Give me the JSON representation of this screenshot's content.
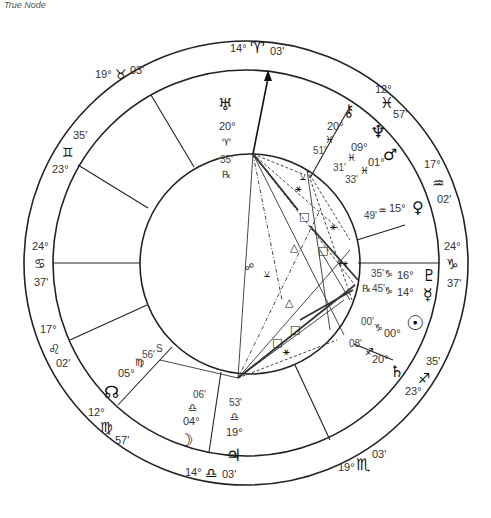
{
  "caption": "True Node",
  "chart": {
    "geometry": {
      "cx": 246,
      "cy": 263,
      "outer_r": 222,
      "middle_r": 193,
      "inner_r": 110
    },
    "sign_cusps": [
      {
        "id": "mc",
        "deg": "14°",
        "sign": "♈",
        "min": "03'",
        "x": 247,
        "y": 50
      },
      {
        "id": "h11",
        "deg": "19°",
        "sign": "♉",
        "min": "03'",
        "x": 120,
        "y": 78
      },
      {
        "id": "h12",
        "deg": "23°",
        "sign": "♊",
        "min": "35'",
        "x": 50,
        "y": 160
      },
      {
        "id": "asc",
        "deg": "24°",
        "sign": "♋",
        "min": "37'",
        "x": 38,
        "y": 263
      },
      {
        "id": "h2",
        "deg": "17°",
        "sign": "♌",
        "min": "02'",
        "x": 52,
        "y": 350
      },
      {
        "id": "h3",
        "deg": "12°",
        "sign": "♍",
        "min": "57'",
        "x": 100,
        "y": 425
      },
      {
        "id": "ic",
        "deg": "14°",
        "sign": "♎",
        "min": "03'",
        "x": 233,
        "y": 480
      },
      {
        "id": "h5",
        "deg": "19°",
        "sign": "♏",
        "min": "03'",
        "x": 375,
        "y": 470
      },
      {
        "id": "h6",
        "deg": "23°",
        "sign": "♐",
        "min": "35'",
        "x": 445,
        "y": 370
      },
      {
        "id": "dsc",
        "deg": "24°",
        "sign": "♑",
        "min": "37'",
        "x": 452,
        "y": 263
      },
      {
        "id": "h8",
        "deg": "17°",
        "sign": "♒",
        "min": "02'",
        "x": 440,
        "y": 160
      },
      {
        "id": "h9",
        "deg": "12°",
        "sign": "♓",
        "min": "57'",
        "x": 385,
        "y": 75
      }
    ],
    "planets": [
      {
        "name": "Uranus",
        "glyph": "♅",
        "deg": "20°",
        "sign": "♈",
        "min": "35'",
        "retro": "℞"
      },
      {
        "name": "Chiron",
        "glyph": "⚷",
        "deg": "20°",
        "sign": "♓",
        "min": "51'",
        "retro": ""
      },
      {
        "name": "Neptune",
        "glyph": "♆",
        "deg": "09°",
        "sign": "♓",
        "min": "31'",
        "retro": ""
      },
      {
        "name": "Mars",
        "glyph": "♂",
        "deg": "01°",
        "sign": "♓",
        "min": "33'",
        "retro": ""
      },
      {
        "name": "Venus",
        "glyph": "♀",
        "deg": "15°",
        "sign": "♒",
        "min": "49'",
        "retro": ""
      },
      {
        "name": "Pluto",
        "glyph": "♇",
        "deg": "16°",
        "sign": "♑",
        "min": "35'",
        "retro": ""
      },
      {
        "name": "Mercury",
        "glyph": "☿",
        "deg": "14°",
        "sign": "♑",
        "min": "45'",
        "retro": "℞"
      },
      {
        "name": "Sun",
        "glyph": "☉",
        "deg": "00°",
        "sign": "♑",
        "min": "00'",
        "retro": ""
      },
      {
        "name": "Saturn",
        "glyph": "♄",
        "deg": "20°",
        "sign": "♐",
        "min": "08'",
        "retro": ""
      },
      {
        "name": "Jupiter",
        "glyph": "♃",
        "deg": "19°",
        "sign": "♎",
        "min": "53'",
        "retro": ""
      },
      {
        "name": "Moon",
        "glyph": "☽",
        "deg": "04°",
        "sign": "♎",
        "min": "06'",
        "retro": ""
      },
      {
        "name": "North Node",
        "glyph": "☊",
        "deg": "05°",
        "sign": "♍",
        "min": "56'",
        "retro": "",
        "suffix": "S"
      }
    ],
    "aspect_symbols": {
      "opposition": "☍",
      "square": "□",
      "trine": "△",
      "sextile": "⚹",
      "semisextile": "⚺"
    }
  }
}
